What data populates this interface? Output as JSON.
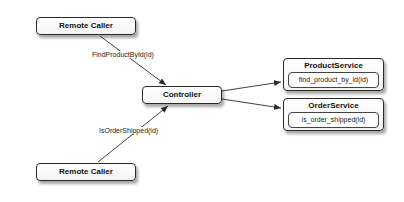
{
  "nodes": {
    "remote_caller_top": {
      "label": "Remote Caller"
    },
    "remote_caller_bottom": {
      "label": "Remote Caller"
    },
    "controller": {
      "label": "Controller"
    },
    "product_service": {
      "label": "ProductService",
      "method": "find_product_by_id(id)"
    },
    "order_service": {
      "label": "OrderService",
      "method": "is_order_shipped(id)"
    }
  },
  "edges": [
    {
      "from": "remote_caller_top",
      "to": "controller",
      "label": "FindProductById(id)"
    },
    {
      "from": "remote_caller_bottom",
      "to": "controller",
      "label": "IsOrderShipped(id)"
    },
    {
      "from": "controller",
      "to": "product_service",
      "label": ""
    },
    {
      "from": "controller",
      "to": "order_service",
      "label": ""
    }
  ],
  "colors": {
    "stroke": "#2a2a2a",
    "background": "#ffffff"
  }
}
